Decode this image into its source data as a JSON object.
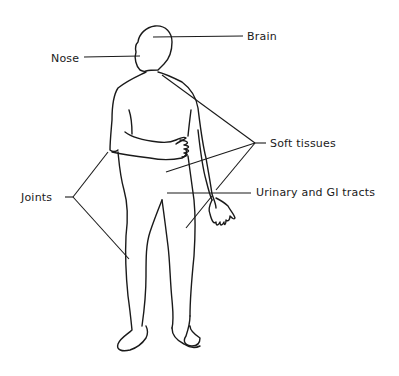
{
  "diagram": {
    "type": "anatomical-callout",
    "labels": [
      {
        "id": "brain",
        "text": "Brain",
        "x": 247,
        "y": 31
      },
      {
        "id": "nose",
        "text": "Nose",
        "x": 51,
        "y": 53
      },
      {
        "id": "soft_tissues",
        "text": "Soft tissues",
        "x": 270,
        "y": 138
      },
      {
        "id": "joints",
        "text": "Joints",
        "x": 21,
        "y": 192
      },
      {
        "id": "urinary_gi",
        "text": "Urinary and GI tracts",
        "x": 256,
        "y": 187
      }
    ],
    "colors": {
      "line": "#1a1a1a",
      "background": "#ffffff"
    }
  }
}
